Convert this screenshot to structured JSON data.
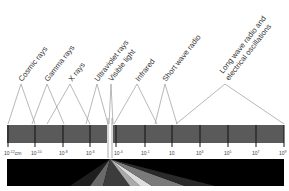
{
  "colors": {
    "bar": "#5a5a5a",
    "tick": "#111111",
    "leader": "#999999",
    "text": "#333333",
    "wedge_bg": "#000000"
  },
  "bands": [
    {
      "label": "Cosmic rays"
    },
    {
      "label": "Gamma rays"
    },
    {
      "label": "X rays"
    },
    {
      "label": "Ultraviolet rays"
    },
    {
      "label": "Visible light"
    },
    {
      "label": "Infrared"
    },
    {
      "label": "Short wave radio"
    },
    {
      "label_line1": "Long wave radio and",
      "label_line2": "electrical oscillations"
    }
  ],
  "ticks": [
    {
      "base": "10",
      "exp": "-12",
      "unit": "cm"
    },
    {
      "base": "10",
      "exp": "-10",
      "unit": ""
    },
    {
      "base": "10",
      "exp": "-8",
      "unit": ""
    },
    {
      "base": "10",
      "exp": "-6",
      "unit": ""
    },
    {
      "base": "10",
      "exp": "-4",
      "unit": ""
    },
    {
      "base": "10",
      "exp": "-1",
      "unit": ""
    },
    {
      "base": "10",
      "exp": "",
      "unit": ""
    },
    {
      "base": "10",
      "exp": "3",
      "unit": ""
    },
    {
      "base": "10",
      "exp": "5",
      "unit": ""
    },
    {
      "base": "10",
      "exp": "7",
      "unit": ""
    },
    {
      "base": "10",
      "exp": "9",
      "unit": ""
    }
  ]
}
